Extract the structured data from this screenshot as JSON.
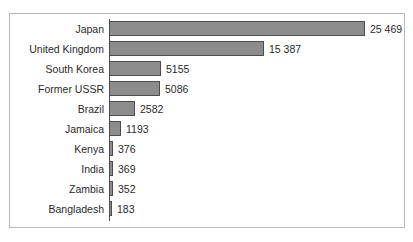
{
  "chart_data": {
    "type": "bar",
    "orientation": "horizontal",
    "title": "",
    "xlabel": "",
    "ylabel": "",
    "grid": false,
    "legend": null,
    "xlim": [
      0,
      25469
    ],
    "categories": [
      "Japan",
      "United Kingdom",
      "South Korea",
      "Former USSR",
      "Brazil",
      "Jamaica",
      "Kenya",
      "India",
      "Zambia",
      "Bangladesh"
    ],
    "values": [
      25469,
      15387,
      5155,
      5086,
      2582,
      1193,
      376,
      369,
      352,
      183
    ],
    "value_labels": [
      "25 469",
      "15 387",
      "5155",
      "5086",
      "2582",
      "1193",
      "376",
      "369",
      "352",
      "183"
    ]
  },
  "style": {
    "bar_fill": "#8c8c8c",
    "bar_border": "#4d4d4d",
    "frame_border": "#b9b9b9",
    "text_color": "#2b2b2b",
    "background": "#ffffff"
  }
}
